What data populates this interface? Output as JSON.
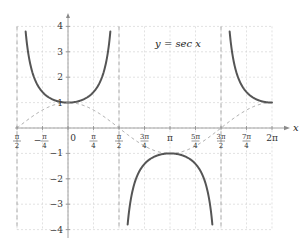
{
  "chart_data": {
    "type": "line",
    "title": "y = sec x",
    "xlabel": "x",
    "ylabel": "",
    "xlim_units_of_pi": [
      -0.5,
      2.0
    ],
    "ylim": [
      -4,
      4
    ],
    "grid": true,
    "x_ticks": [
      {
        "value": -0.5,
        "num": "π",
        "den": "2",
        "sign": "-"
      },
      {
        "value": -0.25,
        "num": "π",
        "den": "4",
        "sign": "−"
      },
      {
        "value": 0,
        "text": "0"
      },
      {
        "value": 0.25,
        "num": "π",
        "den": "4"
      },
      {
        "value": 0.5,
        "num": "π",
        "den": "2"
      },
      {
        "value": 0.75,
        "num": "3π",
        "den": "4"
      },
      {
        "value": 1.0,
        "text": "π"
      },
      {
        "value": 1.25,
        "num": "5π",
        "den": "4"
      },
      {
        "value": 1.5,
        "num": "3π",
        "den": "2"
      },
      {
        "value": 1.75,
        "num": "7π",
        "den": "4"
      },
      {
        "value": 2.0,
        "text": "2π"
      }
    ],
    "y_ticks": [
      -4,
      -3,
      -2,
      -1,
      1,
      2,
      3,
      4
    ],
    "asymptotes_units_of_pi": [
      -0.5,
      0.5,
      1.5
    ],
    "series": [
      {
        "name": "sec x",
        "style": "solid",
        "color": "#555555",
        "function": "sec",
        "clip_y": [
          -3.8,
          3.8
        ]
      },
      {
        "name": "cos x",
        "style": "dashed",
        "color": "#a8a8a8",
        "function": "cos"
      }
    ],
    "annotations": [
      {
        "text": "y = sec x",
        "x_units_of_pi": 1.05,
        "y": 3.3
      }
    ]
  }
}
